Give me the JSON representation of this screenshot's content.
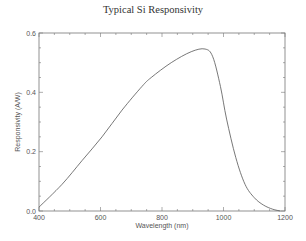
{
  "chart_data": {
    "type": "line",
    "title": "Typical Si Responsivity",
    "xlabel": "Wavelength (nm)",
    "ylabel": "Responsivity (A/W)",
    "xlim": [
      400,
      1200
    ],
    "ylim": [
      0.0,
      0.6
    ],
    "xticks": [
      "400",
      "600",
      "800",
      "1000",
      "1200"
    ],
    "yticks": [
      "0.0",
      "0.2",
      "0.4",
      "0.6"
    ],
    "grid": false,
    "legend": null,
    "series": [
      {
        "name": "Si Responsivity",
        "x": [
          400,
          475,
          540,
          605,
          670,
          735,
          765,
          830,
          895,
          940,
          965,
          990,
          1010,
          1040,
          1070,
          1100,
          1130,
          1160,
          1185
        ],
        "y": [
          0.013,
          0.09,
          0.17,
          0.25,
          0.34,
          0.42,
          0.45,
          0.5,
          0.537,
          0.546,
          0.52,
          0.42,
          0.31,
          0.18,
          0.09,
          0.045,
          0.02,
          0.006,
          0.0
        ]
      }
    ]
  }
}
